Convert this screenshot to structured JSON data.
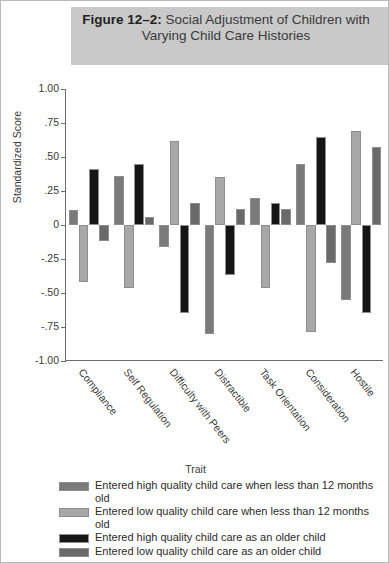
{
  "figure": {
    "title_prefix": "Figure 12–2:",
    "title_rest": "Social Adjustment of Children with Varying Child Care Histories"
  },
  "chart_data": {
    "type": "bar",
    "title": "Figure 12–2: Social Adjustment of Children with Varying Child Care Histories",
    "xlabel": "Trait",
    "ylabel": "Standardized Score",
    "ylim": [
      -1.0,
      1.0
    ],
    "ytick_labels": [
      "1.00",
      ".75",
      ".50",
      ".25",
      "0",
      "-.25",
      "-.50",
      "-.75",
      "-1.00"
    ],
    "ytick_values": [
      1.0,
      0.75,
      0.5,
      0.25,
      0,
      -0.25,
      -0.5,
      -0.75,
      -1.0
    ],
    "grid": false,
    "legend_position": "below",
    "legend_title": "Trait",
    "categories": [
      "Compliance",
      "Self Regulation",
      "Difficulty with Peers",
      "Distractible",
      "Task Orientation",
      "Consideration",
      "Hostile"
    ],
    "series": [
      {
        "name": "Entered high quality child care when less than 12 months old",
        "color": "#7a7a7a",
        "values": [
          0.11,
          0.36,
          -0.16,
          -0.8,
          0.2,
          0.45,
          -0.55
        ]
      },
      {
        "name": "Entered low quality child care when less than 12 months old",
        "color": "#a8a8a8",
        "values": [
          -0.42,
          -0.46,
          0.62,
          0.35,
          -0.46,
          -0.79,
          0.69
        ]
      },
      {
        "name": "Entered high quality child care as an older child",
        "color": "#151515",
        "values": [
          0.41,
          0.45,
          -0.65,
          -0.37,
          0.16,
          0.65,
          -0.65
        ]
      },
      {
        "name": "Entered low quality child care as an older child",
        "color": "#6a6a6a",
        "values": [
          -0.12,
          0.06,
          0.16,
          0.12,
          0.12,
          -0.28,
          0.57
        ]
      }
    ]
  }
}
